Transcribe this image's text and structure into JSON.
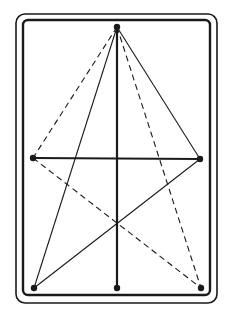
{
  "diagram": {
    "ink_color": "#1a1a1a",
    "background": "#ffffff",
    "outer_frame": {
      "x": 16,
      "y": 14,
      "w": 201,
      "h": 289,
      "rx": 9
    },
    "inner_frame": {
      "x": 23,
      "y": 20,
      "w": 187,
      "h": 275,
      "rx": 5
    },
    "points": [
      {
        "id": "apex",
        "x": 117,
        "y": 27
      },
      {
        "id": "mid-left",
        "x": 33,
        "y": 158
      },
      {
        "id": "mid-right",
        "x": 200,
        "y": 159
      },
      {
        "id": "bottom-left",
        "x": 34,
        "y": 288
      },
      {
        "id": "bottom-center",
        "x": 117,
        "y": 288
      },
      {
        "id": "bottom-right",
        "x": 201,
        "y": 288
      }
    ],
    "lines": [
      {
        "from": "apex",
        "to": "bottom-center",
        "style": "solid",
        "weight": "thick"
      },
      {
        "from": "mid-left",
        "to": "mid-right",
        "style": "solid",
        "weight": "thick"
      },
      {
        "from": "apex",
        "to": "mid-left",
        "style": "dashed",
        "weight": "thin"
      },
      {
        "from": "apex",
        "to": "mid-right",
        "style": "solid",
        "weight": "thin"
      },
      {
        "from": "apex",
        "to": "bottom-left",
        "style": "solid",
        "weight": "thin"
      },
      {
        "from": "apex",
        "to": "bottom-right",
        "style": "dashed",
        "weight": "thin"
      },
      {
        "from": "mid-left",
        "to": "bottom-right",
        "style": "dashed",
        "weight": "thin"
      },
      {
        "from": "mid-right",
        "to": "bottom-left",
        "style": "solid",
        "weight": "thin"
      }
    ]
  }
}
